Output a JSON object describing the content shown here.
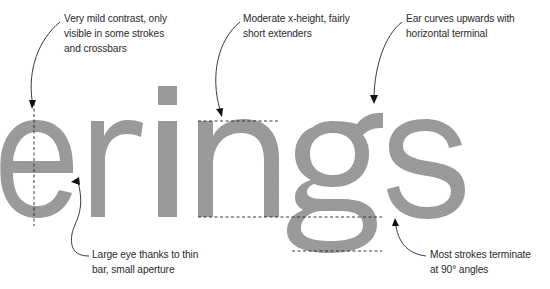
{
  "specimen": {
    "word": "erings",
    "glyph_color": "#9a9a9a",
    "guide_color": "#222222"
  },
  "annotations": [
    {
      "id": "contrast",
      "text": "Very mild contrast, only\nvisible in some strokes\nand crossbars"
    },
    {
      "id": "x-height",
      "text": "Moderate x-height, fairly\nshort extenders"
    },
    {
      "id": "ear",
      "text": "Ear curves upwards with\nhorizontal terminal"
    },
    {
      "id": "eye",
      "text": "Large eye thanks to thin\nbar, small aperture"
    },
    {
      "id": "terminals",
      "text": "Most strokes terminate\nat 90° angles"
    }
  ]
}
